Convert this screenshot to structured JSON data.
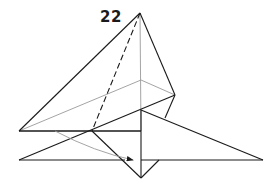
{
  "diagram": {
    "step_number": "22",
    "colors": {
      "line": "#1a1a1a",
      "hidden_line": "#9a9a9a",
      "background": "#ffffff"
    },
    "points": {
      "apex": [
        140,
        13
      ],
      "right_upper": [
        175,
        95
      ],
      "gray_back": [
        141,
        80
      ],
      "left": [
        19,
        131
      ],
      "mid_left": [
        92,
        131
      ],
      "center_crease": [
        141,
        131
      ],
      "flap_top": [
        141,
        110
      ],
      "lower_left": [
        19,
        160
      ],
      "right_tip": [
        263,
        160
      ],
      "bottom": [
        141,
        178
      ],
      "lower_notch": [
        159,
        160
      ],
      "arrow_head": [
        133,
        160
      ]
    }
  }
}
